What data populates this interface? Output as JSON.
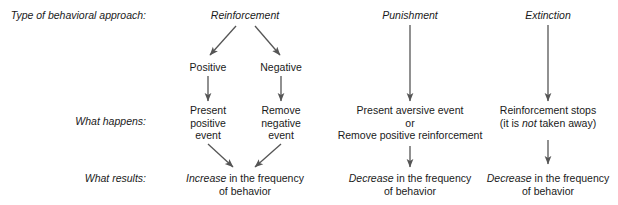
{
  "diagram": {
    "title_row_labels": [
      {
        "id": "approach",
        "text": "Type of behavioral approach:"
      },
      {
        "id": "happens",
        "text": "What happens:"
      },
      {
        "id": "results",
        "text": "What results:"
      }
    ],
    "columns": [
      {
        "id": "reinforcement",
        "header": "Reinforcement",
        "branches": [
          {
            "id": "positive",
            "label": "Positive",
            "happens_lines": [
              "Present",
              "positive",
              "event"
            ]
          },
          {
            "id": "negative",
            "label": "Negative",
            "happens_lines": [
              "Remove",
              "negative",
              "event"
            ]
          }
        ],
        "result_emphasis": "Increase",
        "result_rest": " in the frequency",
        "result_line2": "of behavior"
      },
      {
        "id": "punishment",
        "header": "Punishment",
        "happens_lines": [
          "Present aversive event",
          "or",
          "Remove positive reinforcement"
        ],
        "result_emphasis": "Decrease",
        "result_rest": " in the frequency",
        "result_line2": "of behavior"
      },
      {
        "id": "extinction",
        "header": "Extinction",
        "happens_line1": "Reinforcement stops",
        "happens_line2_pre": "(it is ",
        "happens_line2_em": "not",
        "happens_line2_post": " taken away)",
        "result_emphasis": "Decrease",
        "result_rest": " in the frequency",
        "result_line2": "of behavior"
      }
    ],
    "colors": {
      "arrow": "#555555",
      "text": "#1a1a1a",
      "background": "#ffffff"
    }
  }
}
